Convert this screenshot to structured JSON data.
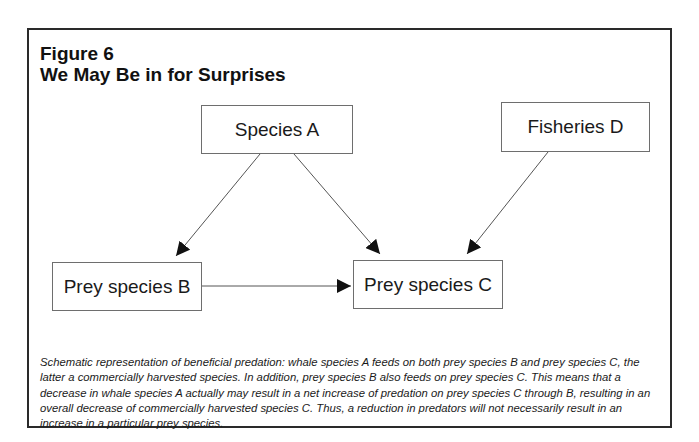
{
  "figure": {
    "label": "Figure 6",
    "title": "We May Be in for Surprises"
  },
  "nodes": {
    "species_a": "Species A",
    "fisheries_d": "Fisheries D",
    "prey_b": "Prey species B",
    "prey_c": "Prey species C"
  },
  "edges": [
    {
      "from": "Species A",
      "to": "Prey species B"
    },
    {
      "from": "Species A",
      "to": "Prey species C"
    },
    {
      "from": "Fisheries D",
      "to": "Prey species C"
    },
    {
      "from": "Prey species B",
      "to": "Prey species C"
    }
  ],
  "caption": "Schematic representation of beneficial predation: whale species A feeds on both prey species B and prey species C, the latter a commercially harvested species. In addition, prey species B also feeds on prey species C. This means that a decrease in whale species A actually may result in a net increase of predation on prey species C through B, resulting in an overall decrease of commercially harvested species C. Thus, a reduction in predators will not necessarily result in an increase in a particular prey species."
}
